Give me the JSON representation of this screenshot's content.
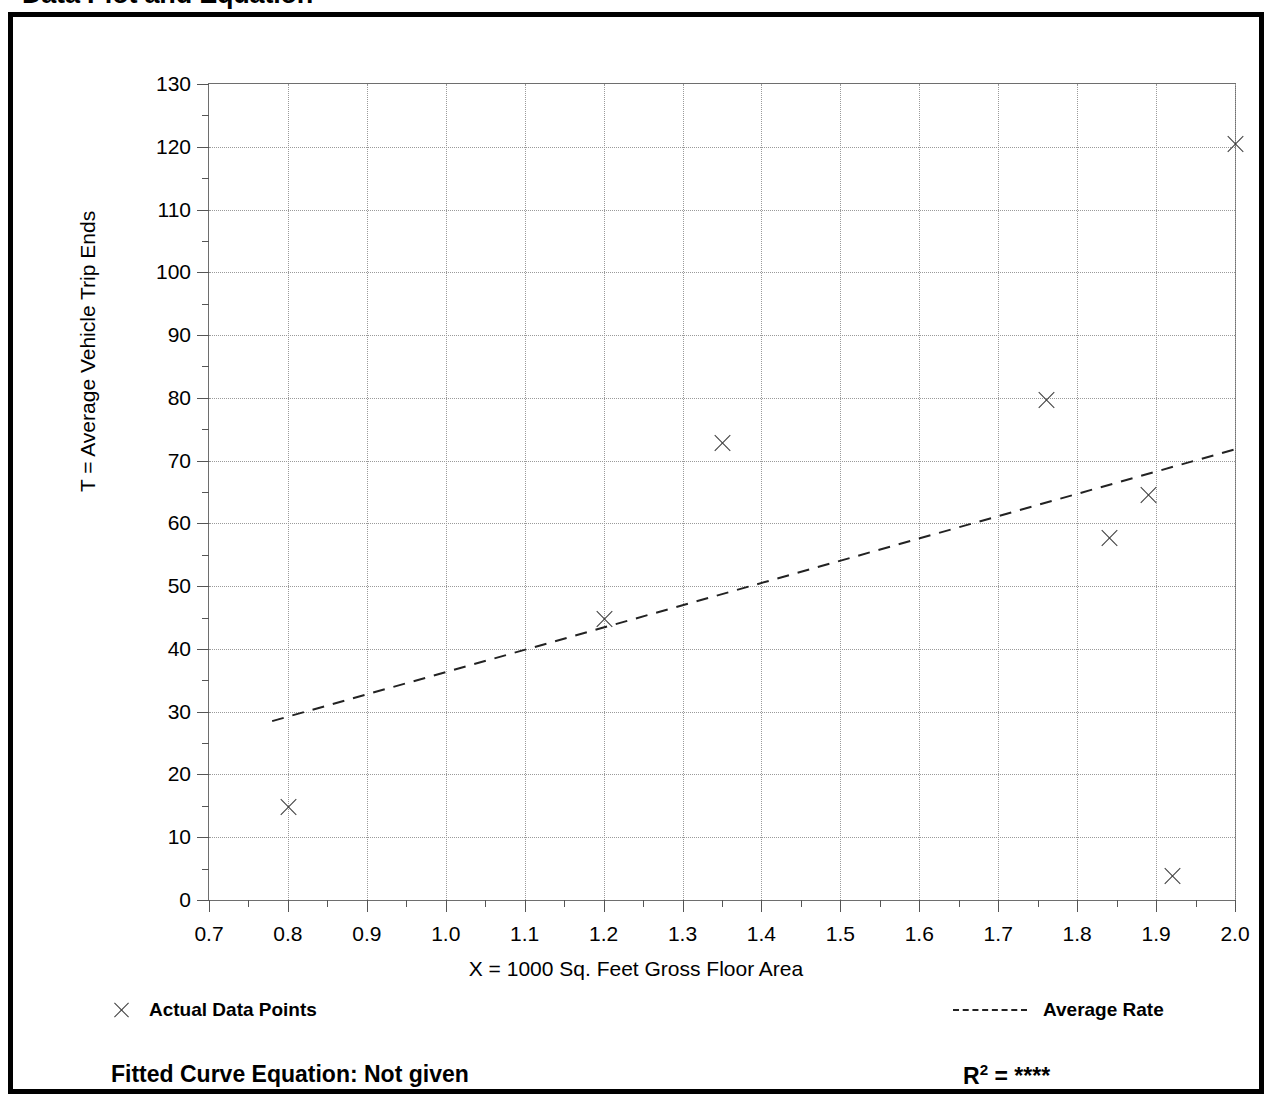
{
  "title": "Data Plot and Equation",
  "axis": {
    "y_title": "T = Average Vehicle Trip Ends",
    "x_title": "X = 1000 Sq. Feet Gross Floor Area"
  },
  "legend": {
    "actual_marker": "x-marker-icon",
    "actual_label": "Actual Data Points",
    "average_marker": "dashed-line-icon",
    "average_label": "Average Rate"
  },
  "equation": {
    "fitted_label": "Fitted Curve Equation:  Not given",
    "r_symbol": "R",
    "r_exponent": "2",
    "r_equals": " = ",
    "r_value": "****"
  },
  "colors": {
    "frame": "#000000",
    "grid": "#9a9a9a",
    "axis": "#6e6e6e",
    "marker": "#3a3a3a",
    "trend": "#222222",
    "background": "#ffffff"
  },
  "chart_data": {
    "type": "scatter",
    "title": "Data Plot and Equation",
    "xlabel": "X = 1000 Sq. Feet Gross Floor Area",
    "ylabel": "T = Average Vehicle Trip Ends",
    "xlim": [
      0.7,
      2.0
    ],
    "ylim": [
      0,
      130
    ],
    "xticks": [
      0.7,
      0.8,
      0.9,
      1.0,
      1.1,
      1.2,
      1.3,
      1.4,
      1.5,
      1.6,
      1.7,
      1.8,
      1.9,
      2.0
    ],
    "xtick_labels": [
      "0.7",
      "0.8",
      "0.9",
      "1.0",
      "1.1",
      "1.2",
      "1.3",
      "1.4",
      "1.5",
      "1.6",
      "1.7",
      "1.8",
      "1.9",
      "2.0"
    ],
    "yticks": [
      0,
      10,
      20,
      30,
      40,
      50,
      60,
      70,
      80,
      90,
      100,
      110,
      120,
      130
    ],
    "ytick_labels": [
      "0",
      "10",
      "20",
      "30",
      "40",
      "50",
      "60",
      "70",
      "80",
      "90",
      "100",
      "110",
      "120",
      "130"
    ],
    "y_minor_tick_step": 5,
    "x_minor_tick_step": 0.05,
    "grid": true,
    "grid_style": "dotted",
    "legend_position": "below-plot",
    "series": [
      {
        "name": "Actual Data Points",
        "type": "scatter",
        "marker": "x",
        "points": [
          {
            "x": 0.8,
            "y": 14.8
          },
          {
            "x": 1.2,
            "y": 44.8
          },
          {
            "x": 1.35,
            "y": 72.8
          },
          {
            "x": 1.76,
            "y": 79.7
          },
          {
            "x": 1.84,
            "y": 57.6
          },
          {
            "x": 1.89,
            "y": 64.5
          },
          {
            "x": 1.92,
            "y": 3.8
          },
          {
            "x": 2.0,
            "y": 120.5
          }
        ]
      },
      {
        "name": "Average Rate",
        "type": "line",
        "style": "dashed",
        "endpoints": [
          {
            "x": 0.78,
            "y": 28.5
          },
          {
            "x": 2.0,
            "y": 71.8
          }
        ]
      }
    ]
  }
}
